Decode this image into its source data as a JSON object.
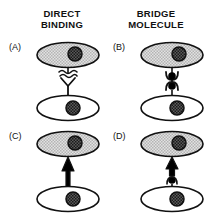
{
  "figure": {
    "background_color": "#ffffff",
    "line_color": "#111111",
    "shaded_cell_fill": "#c9c9c9",
    "plain_cell_fill": "#ffffff",
    "nucleus_fill": "#555555",
    "bridge_bead_fill": "#000000"
  },
  "headings": {
    "left": "DIRECT\nBINDING",
    "right": "BRIDGE\nMOLECULE"
  },
  "panels": [
    {
      "id": "a",
      "label": "(A)",
      "column": "DIRECT BINDING",
      "linker": "receptor-no-binding",
      "linker_description": "Y-shaped receptor on upper cell with squiggle break marks indicating no binding to lower cell",
      "upper_cell": {
        "fill": "shaded",
        "nucleus": "hatched"
      },
      "lower_cell": {
        "fill": "plain",
        "nucleus": "hatched"
      }
    },
    {
      "id": "b",
      "label": "(B)",
      "column": "BRIDGE MOLECULE",
      "linker": "two-beads-unbound",
      "linker_description": "Two black bridge beads in cupped receptors, not joined",
      "upper_cell": {
        "fill": "shaded",
        "nucleus": "hatched"
      },
      "lower_cell": {
        "fill": "plain",
        "nucleus": "hatched"
      }
    },
    {
      "id": "c",
      "label": "(C)",
      "column": "DIRECT BINDING",
      "linker": "arrow-bound",
      "linker_description": "Upward arrow showing direct bound receptor-ligand linkage",
      "upper_cell": {
        "fill": "shaded",
        "nucleus": "hatched"
      },
      "lower_cell": {
        "fill": "plain",
        "nucleus": "hatched"
      }
    },
    {
      "id": "d",
      "label": "(D)",
      "column": "BRIDGE MOLECULE",
      "linker": "arrow-with-bead",
      "linker_description": "Upward arrow with a black bridge bead below it joining the two cells",
      "upper_cell": {
        "fill": "shaded",
        "nucleus": "hatched"
      },
      "lower_cell": {
        "fill": "plain",
        "nucleus": "hatched"
      }
    }
  ]
}
